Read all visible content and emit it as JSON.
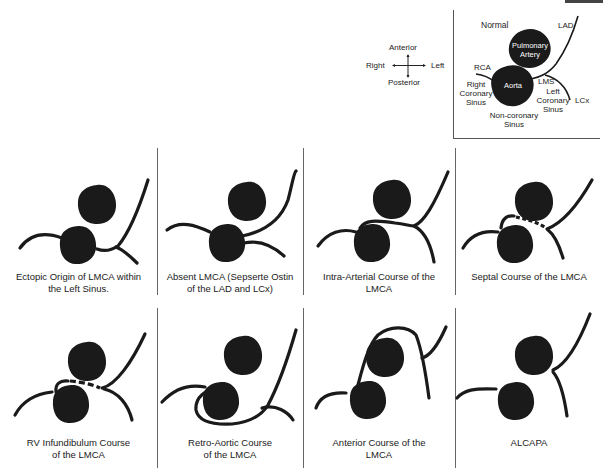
{
  "figure": {
    "orientation": {
      "anterior": "Anterior",
      "posterior": "Posterior",
      "right": "Right",
      "left": "Left"
    },
    "normal_inset": {
      "title": "Normal",
      "labels": {
        "lad": "LAD",
        "pulmonary_artery_line1": "Pulmonary",
        "pulmonary_artery_line2": "Artery",
        "rca": "RCA",
        "aorta": "Aorta",
        "lms": "LMS",
        "right_coronary_sinus_line1": "Right",
        "right_coronary_sinus_line2": "Coronary",
        "right_coronary_sinus_line3": "Sinus",
        "left_coronary_sinus_line1": "Left",
        "left_coronary_sinus_line2": "Coronary",
        "left_coronary_sinus_line3": "Sinus",
        "lcx": "LCx",
        "non_coronary_sinus_line1": "Non-coronary",
        "non_coronary_sinus_line2": "Sinus"
      }
    },
    "panels": [
      {
        "id": "ectopic",
        "caption_line1": "Ectopic Origin of LMCA within",
        "caption_line2": "the Left Sinus."
      },
      {
        "id": "absent",
        "caption_line1": "Absent LMCA (Sepserte Ostin",
        "caption_line2": "of the LAD and LCx)"
      },
      {
        "id": "intra-arterial",
        "caption_line1": "Intra-Arterial Course of the",
        "caption_line2": "LMCA"
      },
      {
        "id": "septal",
        "caption_line1": "Septal Course of the LMCA",
        "caption_line2": ""
      },
      {
        "id": "rv-infundibulum",
        "caption_line1": "RV Infundibulum Course",
        "caption_line2": "of the LMCA"
      },
      {
        "id": "retro-aortic",
        "caption_line1": "Retro-Aortic Course",
        "caption_line2": "of the LMCA"
      },
      {
        "id": "anterior",
        "caption_line1": "Anterior Course of the",
        "caption_line2": "LMCA"
      },
      {
        "id": "alcapa",
        "caption_line1": "ALCAPA",
        "caption_line2": ""
      }
    ],
    "colors": {
      "vessel": "#1a1a1a",
      "divider": "#666666",
      "background": "#ffffff"
    }
  }
}
